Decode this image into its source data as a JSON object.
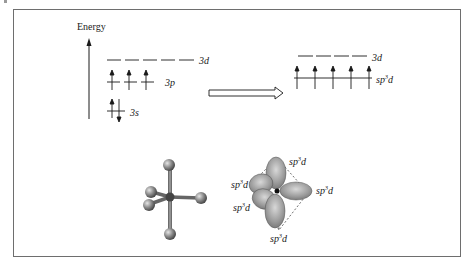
{
  "diagram": {
    "axis_label": "Energy",
    "left_levels": {
      "d": {
        "label": "3d",
        "orbitals": 5,
        "electrons": "empty"
      },
      "p": {
        "label": "3p",
        "orbitals": 3,
        "electrons": "one up-spin each"
      },
      "s": {
        "label": "3s",
        "orbitals": 1,
        "electrons": "paired up/down"
      }
    },
    "arrow": "hybridization",
    "right_levels": {
      "d": {
        "label": "3d",
        "orbitals": 4,
        "electrons": "empty"
      },
      "hybrid": {
        "label_base": "sp",
        "label_sup": "3",
        "label_end": "d",
        "orbitals": 5,
        "electrons": "one up-spin each"
      }
    },
    "molecule": {
      "type": "trigonal bipyramidal ball-and-stick",
      "atoms": 6
    },
    "orbital_lobes": {
      "label_base": "sp",
      "label_sup": "3",
      "label_end": "d",
      "labels": [
        "top",
        "left-upper",
        "right",
        "left-lower",
        "bottom"
      ]
    },
    "colors": {
      "line": "#1a1a1a",
      "frame": "#6e6e6e",
      "atom": "#8c8c8c",
      "lobe": "#9a9a9a"
    }
  }
}
